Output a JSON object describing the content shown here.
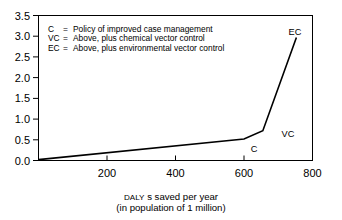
{
  "chart_data": {
    "type": "line",
    "title": "",
    "xlabel": "DALY s saved per year (in population of 1 million)",
    "xlabel_line1_small": "DALY",
    "xlabel_line1_rest": "s saved per year",
    "xlabel_line2": "(in population of 1 million)",
    "ylabel": "",
    "xlim": [
      0,
      800
    ],
    "ylim": [
      0.0,
      3.5
    ],
    "grid": false,
    "x_ticks": [
      200,
      400,
      600,
      800
    ],
    "x_tick_labels": [
      "200",
      "400",
      "600",
      "800"
    ],
    "y_ticks": [
      0.0,
      0.5,
      1.0,
      1.5,
      2.0,
      2.5,
      3.0,
      3.5
    ],
    "y_tick_labels": [
      "0.0",
      "0.5",
      "1.0",
      "1.5",
      "2.0",
      "2.5",
      "3.0",
      "3.5"
    ],
    "series": [
      {
        "name": "cost-effectiveness frontier",
        "x": [
          0,
          600,
          655,
          753
        ],
        "values": [
          0.02,
          0.52,
          0.72,
          2.97
        ]
      }
    ],
    "point_labels": [
      {
        "text": "C",
        "x": 600,
        "y": 0.52
      },
      {
        "text": "VC",
        "x": 655,
        "y": 0.72
      },
      {
        "text": "EC",
        "x": 753,
        "y": 2.97
      }
    ],
    "legend_position": "upper-left-inside",
    "legend": [
      {
        "key": "C",
        "sep": "=",
        "description": "Policy of improved case management"
      },
      {
        "key": "VC",
        "sep": "=",
        "description": "Above, plus chemical vector control"
      },
      {
        "key": "EC",
        "sep": "=",
        "description": "Above, plus environmental vector control"
      }
    ],
    "colors": {
      "line": "#000000",
      "axis": "#000000",
      "text": "#000000",
      "background": "#ffffff"
    }
  }
}
